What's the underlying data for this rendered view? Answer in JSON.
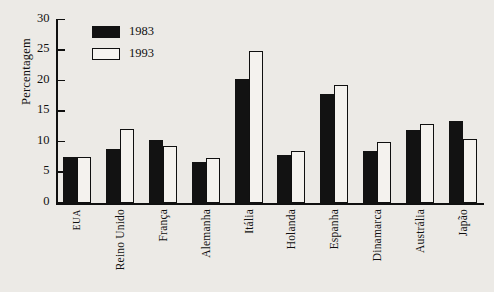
{
  "chart_data": {
    "type": "bar",
    "title": "",
    "subtitle": "",
    "xlabel": "",
    "ylabel": "Percentagem",
    "ylim": [
      0,
      30
    ],
    "yticks": [
      0,
      5,
      10,
      15,
      20,
      25,
      30
    ],
    "grid": false,
    "legend_position": "top-left",
    "categories": [
      "EUA",
      "Reino Unido",
      "França",
      "Alemanha",
      "Itália",
      "Holanda",
      "Espanha",
      "Dinamarca",
      "Austrália",
      "Japão"
    ],
    "series": [
      {
        "name": "1983",
        "color": "#121212",
        "values": [
          7.5,
          8.8,
          10.3,
          6.8,
          20.3,
          7.9,
          17.8,
          8.5,
          12.0,
          13.4
        ]
      },
      {
        "name": "1993",
        "color": "#f4f2ee",
        "values": [
          7.5,
          12.2,
          9.3,
          7.3,
          24.9,
          8.6,
          19.3,
          10.0,
          13.0,
          10.5
        ]
      }
    ]
  },
  "legend": {
    "items": [
      {
        "label": "1983"
      },
      {
        "label": "1993"
      }
    ]
  },
  "colors": {
    "background": "#eceae6",
    "ink": "#101010",
    "series_1983": "#121212",
    "series_1993": "#f4f2ee"
  }
}
